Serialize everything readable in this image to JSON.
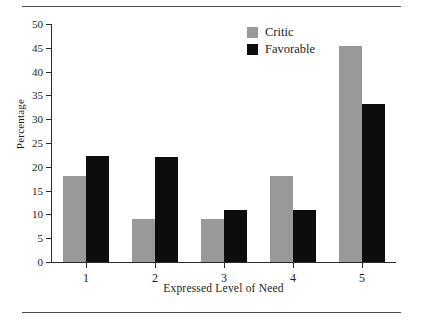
{
  "page": {
    "rule_top": "horizontal-rule",
    "rule_bottom": "horizontal-rule"
  },
  "chart_data": {
    "type": "bar",
    "title": "",
    "xlabel": "Expressed Level of Need",
    "ylabel": "Percentage",
    "categories": [
      "1",
      "2",
      "3",
      "4",
      "5"
    ],
    "series": [
      {
        "name": "Critic",
        "color": "#999999",
        "values": [
          18,
          9,
          9,
          18,
          45.3
        ]
      },
      {
        "name": "Favorable",
        "color": "#0d0d0d",
        "values": [
          22.3,
          22,
          11,
          11,
          33.2
        ]
      }
    ],
    "ylim": [
      0,
      50
    ],
    "ytick_step": 5,
    "yticks": [
      "0",
      "5",
      "10",
      "15",
      "20",
      "25",
      "30",
      "35",
      "40",
      "45",
      "50"
    ],
    "grid": false,
    "legend_position": "top-right",
    "legend": [
      {
        "label": "Critic",
        "color": "#999999"
      },
      {
        "label": "Favorable",
        "color": "#0d0d0d"
      }
    ]
  }
}
